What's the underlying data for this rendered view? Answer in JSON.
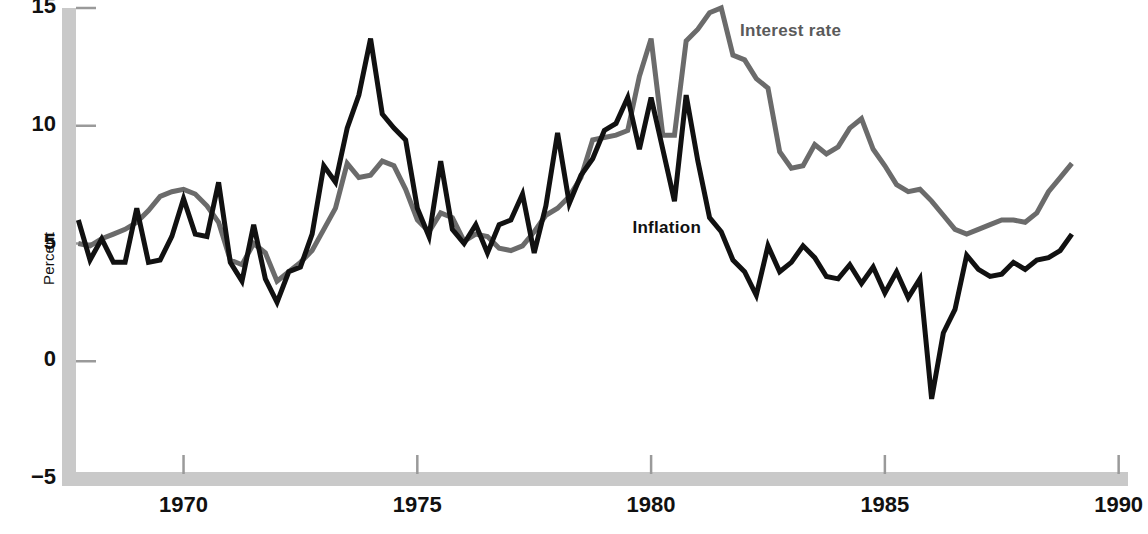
{
  "chart_data": {
    "type": "line",
    "title": "",
    "xlabel": "",
    "ylabel": "Percent",
    "xlim": [
      1967.7,
      1990.2
    ],
    "ylim": [
      -5,
      15
    ],
    "yticks": [
      -5,
      0,
      5,
      10,
      15
    ],
    "ytick_labels": [
      "−5",
      "0",
      "5",
      "10",
      "15"
    ],
    "xticks": [
      1970,
      1975,
      1980,
      1985,
      1990
    ],
    "xtick_labels": [
      "1970",
      "1975",
      "1980",
      "1985",
      "1990"
    ],
    "grid": false,
    "legend_position": "inline-annotations",
    "annotations": [
      {
        "text": "Interest rate",
        "x": 1981.9,
        "y": 14.0,
        "color": "#5a5a5a"
      },
      {
        "text": "Inflation",
        "x": 1979.6,
        "y": 5.6,
        "color": "#111111"
      }
    ],
    "series": [
      {
        "name": "Interest rate",
        "color": "#6b6b6b",
        "x": [
          1967.75,
          1968.0,
          1968.25,
          1968.5,
          1968.75,
          1969.0,
          1969.25,
          1969.5,
          1969.75,
          1970.0,
          1970.25,
          1970.5,
          1970.75,
          1971.0,
          1971.25,
          1971.5,
          1971.75,
          1972.0,
          1972.25,
          1972.5,
          1972.75,
          1973.0,
          1973.25,
          1973.5,
          1973.75,
          1974.0,
          1974.25,
          1974.5,
          1974.75,
          1975.0,
          1975.25,
          1975.5,
          1975.75,
          1976.0,
          1976.25,
          1976.5,
          1976.75,
          1977.0,
          1977.25,
          1977.5,
          1977.75,
          1978.0,
          1978.25,
          1978.5,
          1978.75,
          1979.0,
          1979.25,
          1979.5,
          1979.75,
          1980.0,
          1980.25,
          1980.5,
          1980.75,
          1981.0,
          1981.25,
          1981.5,
          1981.75,
          1982.0,
          1982.25,
          1982.5,
          1982.75,
          1983.0,
          1983.25,
          1983.5,
          1983.75,
          1984.0,
          1984.25,
          1984.5,
          1984.75,
          1985.0,
          1985.25,
          1985.5,
          1985.75,
          1986.0,
          1986.25,
          1986.5,
          1986.75,
          1987.0,
          1987.25,
          1987.5,
          1987.75,
          1988.0,
          1988.25,
          1988.5,
          1988.75,
          1989.0
        ],
        "y": [
          5.0,
          4.9,
          5.2,
          5.4,
          5.6,
          5.9,
          6.4,
          7.0,
          7.2,
          7.3,
          7.1,
          6.6,
          5.9,
          4.3,
          4.1,
          5.0,
          4.6,
          3.4,
          3.8,
          4.2,
          4.7,
          5.6,
          6.5,
          8.4,
          7.8,
          7.9,
          8.5,
          8.3,
          7.3,
          6.0,
          5.5,
          6.3,
          6.1,
          5.1,
          5.4,
          5.3,
          4.8,
          4.7,
          4.9,
          5.5,
          6.2,
          6.5,
          7.0,
          7.8,
          9.4,
          9.5,
          9.6,
          9.8,
          12.1,
          13.7,
          9.6,
          9.6,
          13.6,
          14.1,
          14.8,
          15.0,
          13.0,
          12.8,
          12.0,
          11.6,
          8.9,
          8.2,
          8.3,
          9.2,
          8.8,
          9.1,
          9.9,
          10.3,
          9.0,
          8.3,
          7.5,
          7.2,
          7.3,
          6.8,
          6.2,
          5.6,
          5.4,
          5.6,
          5.8,
          6.0,
          6.0,
          5.9,
          6.3,
          7.2,
          7.8,
          8.4
        ]
      },
      {
        "name": "Inflation",
        "color": "#111111",
        "x": [
          1967.75,
          1968.0,
          1968.25,
          1968.5,
          1968.75,
          1969.0,
          1969.25,
          1969.5,
          1969.75,
          1970.0,
          1970.25,
          1970.5,
          1970.75,
          1971.0,
          1971.25,
          1971.5,
          1971.75,
          1972.0,
          1972.25,
          1972.5,
          1972.75,
          1973.0,
          1973.25,
          1973.5,
          1973.75,
          1974.0,
          1974.25,
          1974.5,
          1974.75,
          1975.0,
          1975.25,
          1975.5,
          1975.75,
          1976.0,
          1976.25,
          1976.5,
          1976.75,
          1977.0,
          1977.25,
          1977.5,
          1977.75,
          1978.0,
          1978.25,
          1978.5,
          1978.75,
          1979.0,
          1979.25,
          1979.5,
          1979.75,
          1980.0,
          1980.25,
          1980.5,
          1980.75,
          1981.0,
          1981.25,
          1981.5,
          1981.75,
          1982.0,
          1982.25,
          1982.5,
          1982.75,
          1983.0,
          1983.25,
          1983.5,
          1983.75,
          1984.0,
          1984.25,
          1984.5,
          1984.75,
          1985.0,
          1985.25,
          1985.5,
          1985.75,
          1986.0,
          1986.25,
          1986.5,
          1986.75,
          1987.0,
          1987.25,
          1987.5,
          1987.75,
          1988.0,
          1988.25,
          1988.5,
          1988.75,
          1989.0
        ],
        "y": [
          6.0,
          4.3,
          5.2,
          4.2,
          4.2,
          6.5,
          4.2,
          4.3,
          5.3,
          6.9,
          5.4,
          5.3,
          7.6,
          4.2,
          3.4,
          5.8,
          3.5,
          2.5,
          3.8,
          4.0,
          5.4,
          8.3,
          7.6,
          9.9,
          11.3,
          13.7,
          10.5,
          9.9,
          9.4,
          6.5,
          5.3,
          8.5,
          5.6,
          5.0,
          5.8,
          4.6,
          5.8,
          6.0,
          7.1,
          4.6,
          6.6,
          9.7,
          6.7,
          7.9,
          8.6,
          9.8,
          10.1,
          11.2,
          9.0,
          11.2,
          9.0,
          6.8,
          11.3,
          8.5,
          6.1,
          5.5,
          4.3,
          3.8,
          2.8,
          4.9,
          3.8,
          4.2,
          4.9,
          4.4,
          3.6,
          3.5,
          4.1,
          3.3,
          4.0,
          2.9,
          3.8,
          2.7,
          3.5,
          -1.6,
          1.2,
          2.2,
          4.5,
          3.9,
          3.6,
          3.7,
          4.2,
          3.9,
          4.3,
          4.4,
          4.7,
          5.4
        ]
      }
    ]
  },
  "axis": {
    "axis_band_color": "#c9c9c9",
    "tick_color": "#9a9a9a"
  }
}
